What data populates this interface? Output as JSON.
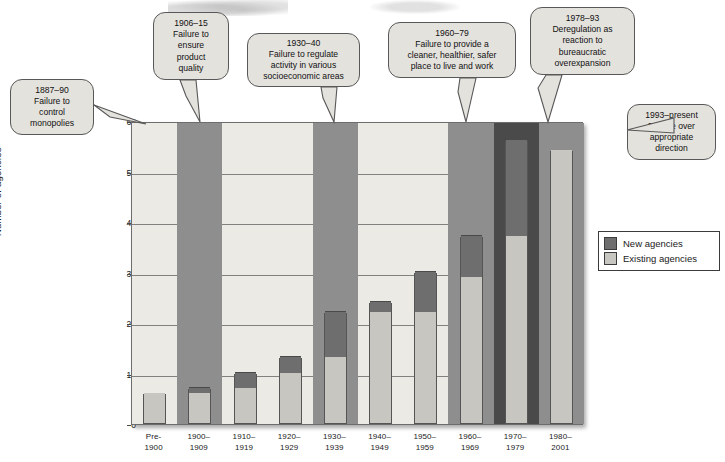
{
  "chart_data": {
    "type": "bar",
    "title": "",
    "xlabel": "",
    "ylabel": "Number of agencies",
    "ylim": [
      0,
      60
    ],
    "yticks": [
      0,
      10,
      20,
      30,
      40,
      50,
      60
    ],
    "grid": true,
    "stacked": true,
    "legend_position": "right",
    "categories": [
      "Pre-\n1900",
      "1900–\n1909",
      "1910–\n1919",
      "1920–\n1929",
      "1930–\n1939",
      "1940–\n1949",
      "1950–\n1959",
      "1960–\n1969",
      "1970–\n1979",
      "1980–\n2001"
    ],
    "category_lines": [
      [
        "Pre-",
        "1900"
      ],
      [
        "1900–",
        "1909"
      ],
      [
        "1910–",
        "1919"
      ],
      [
        "1920–",
        "1929"
      ],
      [
        "1930–",
        "1939"
      ],
      [
        "1940–",
        "1949"
      ],
      [
        "1950–",
        "1959"
      ],
      [
        "1960–",
        "1969"
      ],
      [
        "1970–",
        "1979"
      ],
      [
        "1980–",
        "2001"
      ]
    ],
    "series": [
      {
        "name": "Existing agencies",
        "color": "#c8c6c0",
        "values": [
          6,
          6,
          7,
          10,
          13,
          22,
          22,
          29,
          37,
          54
        ]
      },
      {
        "name": "New agencies",
        "color": "#6e6e6e",
        "values": [
          0,
          1,
          3,
          3,
          9,
          2,
          8,
          8,
          19,
          0
        ]
      }
    ],
    "totals": [
      6,
      7,
      10,
      13,
      22,
      24,
      30,
      37,
      56,
      54
    ],
    "bands": [
      {
        "label": "1887–1900 era",
        "from_category": 0,
        "to_category": 1,
        "shade": "light"
      },
      {
        "label": "1906–15 era",
        "from_category": 1,
        "to_category": 2,
        "shade": "dark"
      },
      {
        "label": "1920s era",
        "from_category": 2,
        "to_category": 4,
        "shade": "light"
      },
      {
        "label": "1930–40 era",
        "from_category": 4,
        "to_category": 5,
        "shade": "dark"
      },
      {
        "label": "1940s–50s era",
        "from_category": 5,
        "to_category": 7,
        "shade": "light"
      },
      {
        "label": "1960–79 era",
        "from_category": 7,
        "to_category": 8,
        "shade": "dark"
      },
      {
        "label": "1978–93 era",
        "from_category": 8,
        "to_category": 9,
        "shade": "darkest"
      },
      {
        "label": "1993–present",
        "from_category": 9,
        "to_category": 10,
        "shade": "dark"
      }
    ]
  },
  "legend": {
    "items": [
      {
        "label": "New agencies",
        "color": "#6e6e6e"
      },
      {
        "label": "Existing agencies",
        "color": "#c8c6c0"
      }
    ]
  },
  "callouts": [
    {
      "id": "c1887",
      "lines": [
        "1887–90",
        "Failure to",
        "control",
        "monopolies"
      ]
    },
    {
      "id": "c1906",
      "lines": [
        "1906–15",
        "Failure to",
        "ensure",
        "product",
        "quality"
      ]
    },
    {
      "id": "c1930",
      "lines": [
        "1930–40",
        "Failure to regulate",
        "activity in various",
        "socioeconomic areas"
      ]
    },
    {
      "id": "c1960",
      "lines": [
        "1960–79",
        "Failure to provide a",
        "cleaner, healthier, safer",
        "place to live and work"
      ]
    },
    {
      "id": "c1978",
      "lines": [
        "1978–93",
        "Deregulation as",
        "reaction to",
        "bureaucratic",
        "overexpansion"
      ]
    },
    {
      "id": "c1993",
      "lines": [
        "1993–present",
        "Debate over",
        "appropriate",
        "direction"
      ]
    }
  ],
  "colors": {
    "band_light": "#eceae4",
    "band_dark": "#8e8e8e",
    "band_darkest": "#4a4a4a",
    "bar_existing": "#c8c6c0",
    "bar_new": "#6e6e6e",
    "callout_fill": "#e4e2dd",
    "stroke": "#585858"
  }
}
